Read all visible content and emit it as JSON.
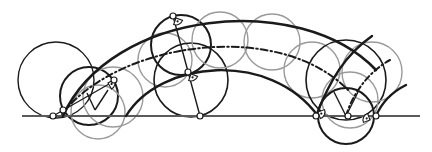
{
  "canvas": {
    "width": 432,
    "height": 152,
    "background": "#ffffff"
  },
  "colors": {
    "dark": "#1a1a1a",
    "gray": "#9a9a9a",
    "ground": "#5a5a5a",
    "point_fill": "#ffffff"
  },
  "ground_line": {
    "x1": 22,
    "y1": 116,
    "x2": 420,
    "y2": 116,
    "width": 2.2
  },
  "arcs": [
    {
      "name": "outer-arc",
      "d": "M 63 116 C 110 10, 300 -10, 376 70",
      "width": 2.6,
      "color": "dark",
      "dash": ""
    },
    {
      "name": "middle-arc-dashed",
      "d": "M 62 114 C 120 40, 280 20, 348 90",
      "width": 2.0,
      "color": "dark",
      "dash": "7 3 1.5 3"
    },
    {
      "name": "inner-arc",
      "d": "M 126 116 C 160 60, 270 50, 318 116",
      "width": 2.4,
      "color": "dark",
      "dash": ""
    },
    {
      "name": "right-arc-outer",
      "d": "M 316 116 C 330 80, 345 55, 372 36",
      "width": 2.4,
      "color": "dark",
      "dash": ""
    },
    {
      "name": "right-arc-dashed",
      "d": "M 346 116 C 352 95, 368 72, 390 60",
      "width": 2.0,
      "color": "dark",
      "dash": "6 3 1.5 3"
    },
    {
      "name": "right-arc-inner",
      "d": "M 376 116 C 382 102, 392 92, 406 85",
      "width": 2.4,
      "color": "dark",
      "dash": ""
    }
  ],
  "circles": [
    {
      "name": "big-left-circle",
      "cx": 56,
      "cy": 80,
      "r": 38,
      "color": "dark",
      "width": 1.4
    },
    {
      "name": "left-mid-circle",
      "cx": 89,
      "cy": 96,
      "r": 29,
      "color": "dark",
      "width": 2.0
    },
    {
      "name": "left-gray-circle-1",
      "cx": 98,
      "cy": 112,
      "r": 27,
      "color": "gray",
      "width": 1.4
    },
    {
      "name": "left-gray-circle-2",
      "cx": 113,
      "cy": 97,
      "r": 30,
      "color": "gray",
      "width": 1.4
    },
    {
      "name": "top-gray-circle-1",
      "cx": 165,
      "cy": 60,
      "r": 27,
      "color": "gray",
      "width": 1.4
    },
    {
      "name": "upper-dark-circle",
      "cx": 181,
      "cy": 45,
      "r": 30,
      "color": "dark",
      "width": 2.0
    },
    {
      "name": "lower-dark-circle",
      "cx": 191,
      "cy": 80,
      "r": 37,
      "color": "dark",
      "width": 1.6
    },
    {
      "name": "top-gray-circle-2",
      "cx": 220,
      "cy": 40,
      "r": 28,
      "color": "gray",
      "width": 1.4
    },
    {
      "name": "top-gray-circle-3",
      "cx": 272,
      "cy": 42,
      "r": 28,
      "color": "gray",
      "width": 1.4
    },
    {
      "name": "right-gray-circle-1",
      "cx": 312,
      "cy": 70,
      "r": 28,
      "color": "gray",
      "width": 1.4
    },
    {
      "name": "right-dark-circle-1",
      "cx": 346,
      "cy": 80,
      "r": 40,
      "color": "dark",
      "width": 1.6
    },
    {
      "name": "right-gray-circle-2",
      "cx": 372,
      "cy": 72,
      "r": 30,
      "color": "gray",
      "width": 1.4
    },
    {
      "name": "right-gray-circle-3",
      "cx": 350,
      "cy": 100,
      "r": 28,
      "color": "gray",
      "width": 1.4
    },
    {
      "name": "right-dark-circle-2",
      "cx": 346,
      "cy": 116,
      "r": 28,
      "color": "dark",
      "width": 2.0
    }
  ],
  "lines": [
    {
      "name": "diameter-line",
      "x1": 173,
      "y1": 16,
      "x2": 200,
      "y2": 116,
      "color": "dark",
      "width": 1.4
    },
    {
      "name": "left-v-line-1",
      "x1": 87,
      "y1": 93,
      "x2": 95,
      "y2": 110,
      "color": "dark",
      "width": 1.4
    },
    {
      "name": "left-v-line-2",
      "x1": 95,
      "y1": 110,
      "x2": 108,
      "y2": 90,
      "color": "dark",
      "width": 1.4
    },
    {
      "name": "right-v-line-1",
      "x1": 334,
      "y1": 92,
      "x2": 346,
      "y2": 116,
      "color": "dark",
      "width": 1.4
    },
    {
      "name": "right-v-line-2",
      "x1": 346,
      "y1": 116,
      "x2": 358,
      "y2": 92,
      "color": "dark",
      "width": 1.4
    },
    {
      "name": "left-tangent-line",
      "x1": 53,
      "y1": 116,
      "x2": 116,
      "y2": 80,
      "color": "dark",
      "width": 1.2
    }
  ],
  "points": [
    {
      "name": "point-left-ground",
      "cx": 53,
      "cy": 116
    },
    {
      "name": "point-left-start",
      "cx": 63,
      "cy": 110
    },
    {
      "name": "point-left-mid",
      "cx": 114,
      "cy": 80
    },
    {
      "name": "point-top",
      "cx": 173,
      "cy": 16
    },
    {
      "name": "point-mid",
      "cx": 188,
      "cy": 72
    },
    {
      "name": "point-bottom",
      "cx": 200,
      "cy": 116
    },
    {
      "name": "point-right-1",
      "cx": 316,
      "cy": 116
    },
    {
      "name": "point-right-2",
      "cx": 348,
      "cy": 116
    },
    {
      "name": "point-right-3",
      "cx": 376,
      "cy": 116
    }
  ],
  "right_angle_marks": [
    {
      "name": "right-angle-top",
      "x": 176,
      "y": 18,
      "rot": 20
    },
    {
      "name": "right-angle-mid",
      "x": 191,
      "y": 74,
      "rot": 20
    },
    {
      "name": "right-angle-left",
      "x": 108,
      "y": 83,
      "rot": -30
    },
    {
      "name": "right-angle-right-1",
      "x": 318,
      "y": 112,
      "rot": -20
    },
    {
      "name": "right-angle-right-3",
      "x": 370,
      "y": 120,
      "rot": 160
    }
  ]
}
